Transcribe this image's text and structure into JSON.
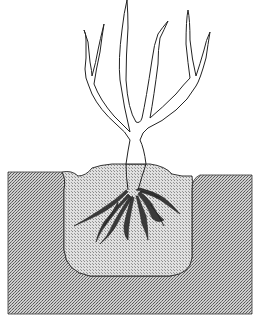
{
  "illustration": {
    "subject": "Bare-root shrub planted in a hole",
    "elements": [
      "branches",
      "trunk",
      "backfill mound",
      "planting hole",
      "roots",
      "surrounding soil"
    ],
    "colors": {
      "background": "#ffffff",
      "line": "#222222",
      "soil_light": "#d8d8d8",
      "soil_dark": "#6a6a6a",
      "backfill_light": "#e4e4e4",
      "backfill_dark": "#8a8a8a"
    }
  }
}
